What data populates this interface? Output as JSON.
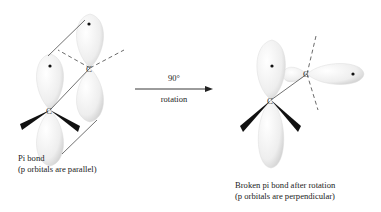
{
  "left": {
    "caption_line1": "Pi bond",
    "caption_line2": "(p orbitals are parallel)",
    "atom_labels": [
      "C",
      "C"
    ]
  },
  "arrow": {
    "top_label": "90°",
    "bottom_label": "rotation"
  },
  "right": {
    "caption_line1": "Broken pi bond after rotation",
    "caption_line2": "(p orbitals are perpendicular)",
    "atom_labels": [
      "C",
      "C"
    ]
  }
}
